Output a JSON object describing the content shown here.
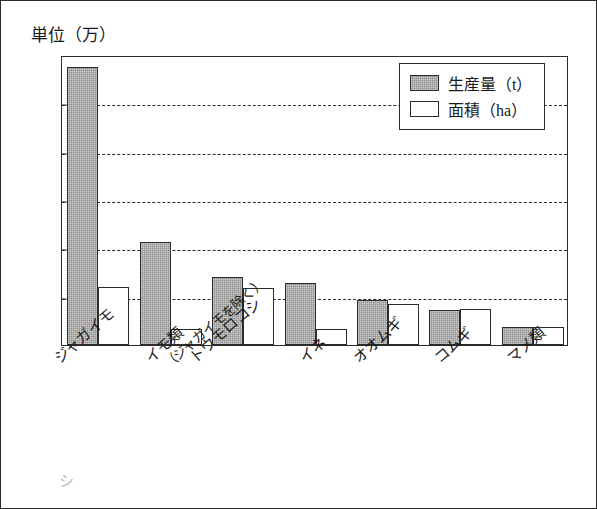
{
  "page": {
    "axis_unit_title": "単位（万）"
  },
  "legend": {
    "items": [
      {
        "label": "生産量（t）",
        "swatch": "filled-gray-square",
        "color": "#8e8e8e"
      },
      {
        "label": "面積（ha）",
        "swatch": "white-square",
        "color": "#ffffff"
      }
    ]
  },
  "chart_data": {
    "type": "bar",
    "title": "単位（万）",
    "xlabel": "",
    "ylabel": "単位（万）",
    "ylim": [
      0,
      120
    ],
    "yticks": [
      0,
      20,
      40,
      60,
      80,
      100,
      120
    ],
    "grid": true,
    "legend_position": "top-right",
    "categories": [
      "ジャガイモ",
      "イモ類（ジャガイモを除く）",
      "トウモロコシ",
      "イネ",
      "オオムギ",
      "コムギ",
      "マメ類"
    ],
    "category_lines": [
      [
        "ジャガイモ"
      ],
      [
        "イモ類",
        "（ジャガイモを除く）"
      ],
      [
        "トウモロコシ"
      ],
      [
        "イネ"
      ],
      [
        "オオムギ"
      ],
      [
        "コムギ"
      ],
      [
        "マメ類"
      ]
    ],
    "series": [
      {
        "name": "生産量（t）",
        "color": "#8e8e8e",
        "values": [
          115,
          42.5,
          28,
          25.5,
          18.5,
          14.5,
          7.5
        ]
      },
      {
        "name": "面積（ha）",
        "color": "#ffffff",
        "values": [
          24,
          6.5,
          23.5,
          6.5,
          17,
          15,
          7.5
        ]
      }
    ]
  },
  "marks": {
    "corner_smudge": "シ"
  }
}
